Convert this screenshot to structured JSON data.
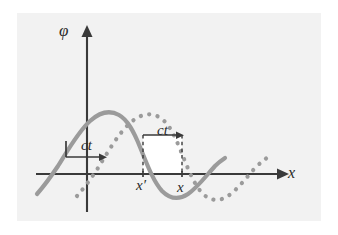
{
  "figure": {
    "type": "diagram",
    "background_color": "#ffffff",
    "panel_color": "#f2f2f2",
    "curve_color": "#9b9b9b",
    "axis_color": "#3a3a3a",
    "axes": {
      "vertical": {
        "name": "phi-axis",
        "label": "φ",
        "arrow": "up"
      },
      "horizontal": {
        "name": "x-axis",
        "label": "x",
        "arrow": "right"
      }
    },
    "annotations": [
      {
        "name": "ct-left",
        "label": "ct",
        "meaning": "shift distance at left of diagram"
      },
      {
        "name": "ct-right",
        "label": "ct",
        "meaning": "shift distance between x-prime and x"
      },
      {
        "name": "tick-x-prime",
        "label": "x′"
      },
      {
        "name": "tick-x",
        "label": "x"
      }
    ],
    "curves": [
      {
        "name": "wave-initial",
        "style": "solid",
        "meaning": "wave profile at time 0"
      },
      {
        "name": "wave-shifted",
        "style": "dotted",
        "meaning": "wave profile displaced by ct"
      }
    ]
  }
}
